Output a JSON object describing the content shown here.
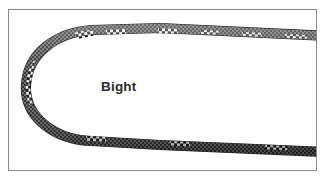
{
  "figure": {
    "title": "Bight",
    "label": "Bight",
    "background_color": "#ffffff",
    "frame": {
      "border_color": "#8a8a8a",
      "border_width": 1,
      "x": 8,
      "y": 9,
      "width": 309,
      "height": 162
    },
    "label_position": {
      "x": 101,
      "y": 79
    },
    "label_color": "#2b2b2b",
    "label_font_size": 13.5,
    "label_bold": true
  },
  "rope": {
    "description": "A single length of rope folded back on itself forming a U-shaped bight open to the right",
    "stroke_width": 9,
    "base_color": "#4a4a4a",
    "weave_dark": "#2e2e2e",
    "weave_light": "#6f6f6f",
    "highlight_color": "#f2f2f2",
    "marker_dark": "#141414",
    "marker_light": "#ededed",
    "path": "M 327 36 L 160 28 L 92 30 C 58 32 28 52 26 85 C 24 118 56 140 92 141 L 160 145 L 327 152",
    "checkered_markers": [
      {
        "t": 0.04,
        "length": 22,
        "label": "marker-top-right-outer"
      },
      {
        "t": 0.14,
        "length": 20,
        "label": "marker-top-right-mid"
      },
      {
        "t": 0.23,
        "length": 18,
        "label": "marker-top-mid"
      },
      {
        "t": 0.33,
        "length": 20,
        "label": "marker-top-left"
      },
      {
        "t": 0.46,
        "length": 22,
        "label": "marker-bend-upper"
      },
      {
        "t": 0.53,
        "length": 20,
        "label": "marker-bend-lower"
      },
      {
        "t": 0.68,
        "length": 20,
        "label": "marker-bottom-left"
      },
      {
        "t": 0.8,
        "length": 20,
        "label": "marker-bottom-mid"
      },
      {
        "t": 0.93,
        "length": 22,
        "label": "marker-bottom-right"
      }
    ]
  }
}
